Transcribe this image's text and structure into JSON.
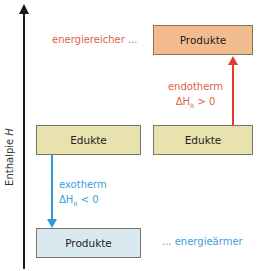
{
  "axis": {
    "label_prefix": "Enthalpie ",
    "label_symbol": "H"
  },
  "boxes": {
    "products_high": {
      "label": "Produkte",
      "color": "#f3bc8e"
    },
    "reactants_left": {
      "label": "Edukte",
      "color": "#e8e2ae"
    },
    "reactants_right": {
      "label": "Edukte",
      "color": "#e8e2ae"
    },
    "products_low": {
      "label": "Produkte",
      "color": "#d8eaf0"
    }
  },
  "annotations": {
    "energy_high": "energiereicher ...",
    "energy_low": "... energieärmer",
    "endothermic": {
      "title": "endotherm",
      "delta": "ΔH",
      "sub": "R",
      "relation": " > 0",
      "color": "#e53a25"
    },
    "exothermic": {
      "title": "exotherm",
      "delta": "ΔH",
      "sub": "R",
      "relation": " < 0",
      "color": "#2c9ad8"
    }
  }
}
